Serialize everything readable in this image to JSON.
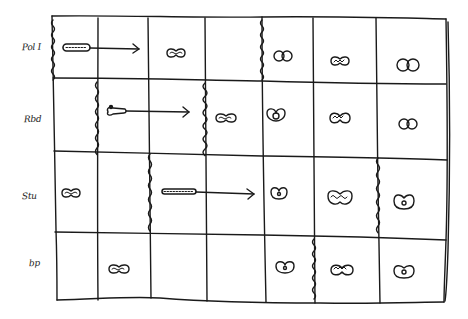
{
  "diagram": {
    "title": "",
    "stroke_color": "#1a1a1a",
    "background": "#ffffff",
    "columns": 7,
    "rows": [
      {
        "label": "Pol I",
        "label_pos": [
          22,
          48
        ],
        "wavy_boundary_col": 0,
        "cells": [
          {
            "col": 0,
            "symbol": "rod-beaded-long",
            "arrow_to": 1
          },
          {
            "col": 1,
            "symbol": "none"
          },
          {
            "col": 2,
            "symbol": "kiss-wave"
          },
          {
            "col": 3,
            "symbol": "none"
          },
          {
            "col": 4,
            "symbol": "double-ring"
          },
          {
            "col": 5,
            "symbol": "kiss-wave"
          },
          {
            "col": 6,
            "symbol": "double-ring"
          }
        ],
        "wavy_lines": [
          0,
          4
        ]
      },
      {
        "label": "Rbd",
        "label_pos": [
          22,
          120
        ],
        "cells": [
          {
            "col": 0,
            "symbol": "none"
          },
          {
            "col": 1,
            "symbol": "tadpole",
            "arrow_to": 2
          },
          {
            "col": 2,
            "symbol": "none"
          },
          {
            "col": 3,
            "symbol": "kiss-wave"
          },
          {
            "col": 4,
            "symbol": "double-ring"
          },
          {
            "col": 5,
            "symbol": "kiss-wave"
          },
          {
            "col": 6,
            "symbol": "double-ring"
          }
        ],
        "wavy_lines": [
          1,
          3
        ]
      },
      {
        "label": "Stu",
        "label_pos": [
          20,
          197
        ],
        "cells": [
          {
            "col": 0,
            "symbol": "kiss-wave"
          },
          {
            "col": 1,
            "symbol": "none"
          },
          {
            "col": 2,
            "symbol": "rod-beaded-long",
            "arrow_to": 3
          },
          {
            "col": 3,
            "symbol": "none"
          },
          {
            "col": 4,
            "symbol": "ring-dot"
          },
          {
            "col": 5,
            "symbol": "kiss-wave-large"
          },
          {
            "col": 6,
            "symbol": "ring-dot"
          }
        ],
        "wavy_lines": [
          2,
          6
        ]
      },
      {
        "label": "bp",
        "label_pos": [
          28,
          265
        ],
        "cells": [
          {
            "col": 0,
            "symbol": "none"
          },
          {
            "col": 1,
            "symbol": "kiss-wave"
          },
          {
            "col": 2,
            "symbol": "none"
          },
          {
            "col": 3,
            "symbol": "none"
          },
          {
            "col": 4,
            "symbol": "ring-dot"
          },
          {
            "col": 5,
            "symbol": "kiss-wave"
          },
          {
            "col": 6,
            "symbol": "ring-dot"
          }
        ],
        "wavy_lines": [
          5
        ]
      }
    ]
  }
}
